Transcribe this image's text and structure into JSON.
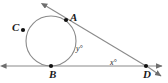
{
  "figure": {
    "type": "geometry-diagram",
    "background_color": "#ffffff",
    "stroke_color": "#808080",
    "label_color": "#1a1a1a",
    "point_color": "#111111",
    "width": 168,
    "height": 83
  },
  "labels": {
    "point_a": "A",
    "point_b": "B",
    "point_c": "C",
    "point_d": "D",
    "angle_y": "y°",
    "angle_x": "x°"
  },
  "points": [
    {
      "name": "A",
      "label": "A",
      "x": 66,
      "y": 20
    },
    {
      "name": "B",
      "label": "B",
      "x": 51,
      "y": 66
    },
    {
      "name": "C",
      "label": "C",
      "x": 23,
      "y": 30
    },
    {
      "name": "D",
      "label": "D",
      "x": 146,
      "y": 66
    }
  ],
  "circle": {
    "center_x": 51,
    "center_y": 41,
    "radius": 25
  },
  "lines": [
    {
      "name": "tangent-at-A",
      "from_x": 44,
      "from_y": 4,
      "to_x": 146,
      "to_y": 66,
      "arrow_start": true,
      "arrow_end": false
    },
    {
      "name": "horizontal-tangent-at-B",
      "from_x": 3,
      "from_y": 66,
      "to_x": 165,
      "to_y": 66,
      "arrow_start": true,
      "arrow_end": true
    },
    {
      "name": "ray-past-D",
      "from_x": 146,
      "from_y": 66,
      "to_x": 163,
      "to_y": 77,
      "arrow_start": false,
      "arrow_end": true
    }
  ],
  "angles": [
    {
      "name": "angle-y",
      "label": "y°",
      "x": 76,
      "y": 45,
      "vertex": "A"
    },
    {
      "name": "angle-x",
      "label": "x°",
      "x": 110,
      "y": 59,
      "vertex": "D"
    }
  ]
}
